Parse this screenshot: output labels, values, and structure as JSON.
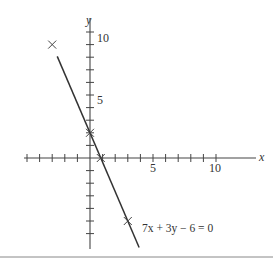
{
  "chart_data": {
    "type": "line",
    "title": "",
    "xlabel": "x",
    "ylabel": "y",
    "xlim": [
      -6,
      13
    ],
    "ylim": [
      -7,
      12
    ],
    "x_ticks": [
      -5,
      -4,
      -3,
      -2,
      -1,
      1,
      2,
      3,
      4,
      5,
      6,
      7,
      8,
      9,
      10
    ],
    "x_tick_labels": {
      "5": "5",
      "10": "10"
    },
    "y_ticks": [
      -6,
      -5,
      -4,
      -3,
      -2,
      -1,
      1,
      2,
      3,
      4,
      5,
      6,
      7,
      8,
      9,
      10
    ],
    "y_tick_labels": {
      "5": "5",
      "10": "10"
    },
    "grid": false,
    "series": [
      {
        "name": "7x + 3y - 6 = 0",
        "equation": "y = (6 - 7x) / 3",
        "x_range": [
          -2.6,
          3.9
        ],
        "marked_points": [
          [
            -3,
            9
          ],
          [
            0,
            2
          ],
          [
            0.857,
            0
          ],
          [
            3,
            -5
          ]
        ]
      }
    ],
    "annotation": "7x + 3y − 6 = 0"
  },
  "labels": {
    "x_axis": "x",
    "y_axis": "y",
    "tick_5_x": "5",
    "tick_10_x": "10",
    "tick_5_y": "5",
    "tick_10_y": "10",
    "equation": "7x + 3y − 6 = 0"
  }
}
